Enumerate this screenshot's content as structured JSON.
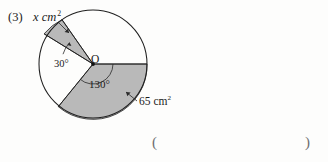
{
  "worksheet": {
    "problem_number": "(3)",
    "answer_blank": {
      "open_paren": "(",
      "close_paren": ")"
    }
  },
  "figure": {
    "type": "circle-sector-diagram",
    "center_label": "O",
    "labels": {
      "unknown_area": "x cm",
      "unknown_area_exponent": "2",
      "small_angle": "30°",
      "large_angle": "130°",
      "known_area": "65 cm",
      "known_area_exponent": "2"
    },
    "colors": {
      "sector_fill": "#b9b9b9",
      "stroke": "#252525",
      "page_background": "#fdfdfc",
      "blank_paren": "#6d6d70"
    },
    "geometry": {
      "center_x": 93,
      "center_y": 64,
      "radius": 54,
      "small_sector_start_deg": 125,
      "small_sector_end_deg": 155,
      "large_sector_start_deg": 0,
      "large_sector_end_deg": -130
    }
  }
}
